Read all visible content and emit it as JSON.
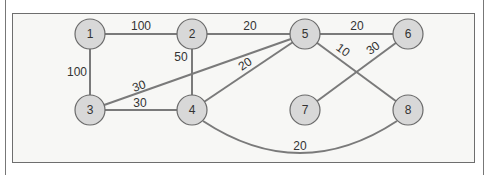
{
  "diagram": {
    "type": "weighted-undirected-graph",
    "nodes": [
      {
        "id": "1",
        "label": "1",
        "x": 90,
        "y": 34
      },
      {
        "id": "2",
        "label": "2",
        "x": 192,
        "y": 34
      },
      {
        "id": "5",
        "label": "5",
        "x": 305,
        "y": 34
      },
      {
        "id": "6",
        "label": "6",
        "x": 408,
        "y": 34
      },
      {
        "id": "3",
        "label": "3",
        "x": 90,
        "y": 110
      },
      {
        "id": "4",
        "label": "4",
        "x": 192,
        "y": 110
      },
      {
        "id": "7",
        "label": "7",
        "x": 305,
        "y": 110
      },
      {
        "id": "8",
        "label": "8",
        "x": 408,
        "y": 110
      }
    ],
    "edges": [
      {
        "from": "1",
        "to": "2",
        "weight": "100"
      },
      {
        "from": "2",
        "to": "5",
        "weight": "20"
      },
      {
        "from": "5",
        "to": "6",
        "weight": "20"
      },
      {
        "from": "1",
        "to": "3",
        "weight": "100"
      },
      {
        "from": "2",
        "to": "4",
        "weight": "50"
      },
      {
        "from": "3",
        "to": "5",
        "weight": "30"
      },
      {
        "from": "3",
        "to": "4",
        "weight": "30"
      },
      {
        "from": "4",
        "to": "5",
        "weight": "20"
      },
      {
        "from": "5",
        "to": "8",
        "weight": "10"
      },
      {
        "from": "6",
        "to": "7",
        "weight": "30"
      },
      {
        "from": "4",
        "to": "8",
        "weight": "20",
        "curved": true
      }
    ]
  }
}
